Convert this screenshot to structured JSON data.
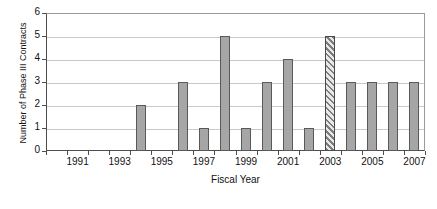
{
  "chart_data": {
    "type": "bar",
    "title": "",
    "xlabel": "Fiscal Year",
    "ylabel": "Number of Phase III Contracts",
    "categories": [
      1990,
      1991,
      1992,
      1993,
      1994,
      1995,
      1996,
      1997,
      1998,
      1999,
      2000,
      2001,
      2002,
      2003,
      2004,
      2005,
      2006,
      2007
    ],
    "values": [
      0,
      0,
      0,
      0,
      2,
      0,
      3,
      1,
      5,
      1,
      3,
      4,
      1,
      5,
      3,
      3,
      3,
      3
    ],
    "ylim": [
      0,
      6
    ],
    "yticks": [
      0,
      1,
      2,
      3,
      4,
      5,
      6
    ],
    "ytick_labels": [
      "0",
      "1",
      "2",
      "3",
      "4",
      "5",
      "6"
    ],
    "xtick_labels": [
      "1991",
      "1993",
      "1995",
      "1997",
      "1999",
      "2001",
      "2003",
      "2005",
      "2007"
    ],
    "xtick_years": [
      1991,
      1993,
      1995,
      1997,
      1999,
      2001,
      2003,
      2005,
      2007
    ],
    "grid": true,
    "legend": "none",
    "bar_fill_color": "#a6a6a6",
    "bar_edge_color": "#595959",
    "highlight_year": 2003,
    "highlight_style": "diagonal-hatch",
    "highlight_note": "2003 bar drawn with diagonal hatch pattern"
  },
  "caption": {
    "clipped_text": ""
  }
}
